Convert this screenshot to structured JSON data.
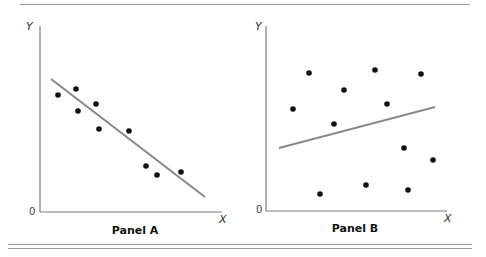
{
  "chart_data": [
    {
      "type": "scatter",
      "title": "Panel A",
      "xlabel": "X",
      "ylabel": "Y",
      "origin_label": "0",
      "grid": false,
      "trend_line": {
        "x1": 51,
        "y1": 79,
        "x2": 205,
        "y2": 197,
        "direction": "negative",
        "color": "#8a8a8a"
      },
      "points_px": [
        [
          58,
          95
        ],
        [
          76,
          89
        ],
        [
          78,
          111
        ],
        [
          96,
          104
        ],
        [
          99,
          129
        ],
        [
          129,
          131
        ],
        [
          146,
          166
        ],
        [
          157,
          175
        ],
        [
          181,
          172
        ]
      ],
      "axes_px": {
        "x0": 40,
        "y0": 212,
        "y_top": 26,
        "x_right": 222
      }
    },
    {
      "type": "scatter",
      "title": "Panel B",
      "xlabel": "X",
      "ylabel": "Y",
      "origin_label": "0",
      "grid": false,
      "trend_line": {
        "x1": 279,
        "y1": 148,
        "x2": 435,
        "y2": 107,
        "direction": "positive (weak)",
        "color": "#8a8a8a"
      },
      "points_px": [
        [
          293,
          109
        ],
        [
          309,
          73
        ],
        [
          320,
          194
        ],
        [
          344,
          90
        ],
        [
          334,
          124
        ],
        [
          375,
          70
        ],
        [
          387,
          104
        ],
        [
          366,
          185
        ],
        [
          404,
          148
        ],
        [
          421,
          74
        ],
        [
          433,
          160
        ],
        [
          408,
          190
        ]
      ],
      "axes_px": {
        "x0": 266,
        "y0": 211,
        "y_top": 26,
        "x_right": 447
      }
    }
  ],
  "panels": {
    "a": {
      "title": "Panel A",
      "x_label": "X",
      "y_label": "Y",
      "origin": "0"
    },
    "b": {
      "title": "Panel B",
      "x_label": "X",
      "y_label": "Y",
      "origin": "0"
    }
  },
  "colors": {
    "axis": "#7a7a7a",
    "line": "#8a8a8a",
    "point": "#111111",
    "rule": "#9a9a9a"
  }
}
